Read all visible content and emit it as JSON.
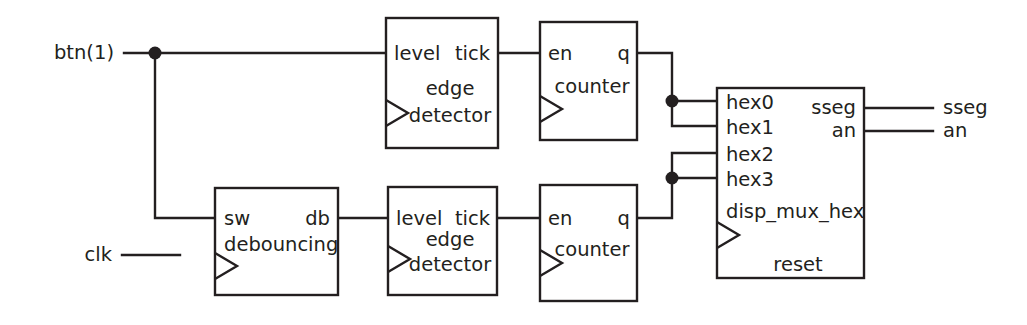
{
  "diagram": {
    "stroke_color": "#231f20",
    "background_color": "#ffffff",
    "signals": {
      "btn": "btn(1)",
      "clk": "clk",
      "sseg_out": "sseg",
      "an_out": "an"
    },
    "blocks": [
      {
        "id": "edge_detector_top",
        "name": "edge",
        "name2": "detector",
        "in_port": "level",
        "out_port": "tick",
        "has_clock": true
      },
      {
        "id": "counter_top",
        "name": "counter",
        "in_port": "en",
        "out_port": "q",
        "has_clock": true
      },
      {
        "id": "debouncing",
        "name": "debouncing",
        "in_port": "sw",
        "out_port": "db",
        "has_clock": true
      },
      {
        "id": "edge_detector_bottom",
        "name": "edge",
        "name2": "detector",
        "in_port": "level",
        "out_port": "tick",
        "has_clock": true
      },
      {
        "id": "counter_bottom",
        "name": "counter",
        "in_port": "en",
        "out_port": "q",
        "has_clock": true
      },
      {
        "id": "disp_mux_hex",
        "name": "disp_mux_hex",
        "reset_label": "reset",
        "in_ports": [
          "hex0",
          "hex1",
          "hex2",
          "hex3"
        ],
        "out_ports": [
          "sseg",
          "an"
        ],
        "has_clock": true
      }
    ],
    "labels": {
      "level": "level",
      "tick": "tick",
      "edge": "edge",
      "detector": "detector",
      "en": "en",
      "q": "q",
      "counter": "counter",
      "sw": "sw",
      "db": "db",
      "debouncing": "debouncing",
      "hex0": "hex0",
      "hex1": "hex1",
      "hex2": "hex2",
      "hex3": "hex3",
      "sseg": "sseg",
      "an": "an",
      "disp_mux_hex": "disp_mux_hex",
      "reset": "reset"
    }
  }
}
